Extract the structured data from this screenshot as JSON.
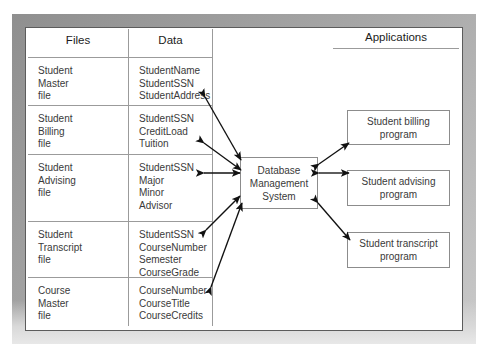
{
  "diagram": {
    "title_applications": "Applications",
    "table": {
      "headers": [
        "Files",
        "Data"
      ],
      "rows": [
        {
          "file": "Student\nMaster\nfile",
          "data": "StudentName\nStudentSSN\nStudentAddress"
        },
        {
          "file": "Student\nBilling\nfile",
          "data": "StudentSSN\nCreditLoad\nTuition"
        },
        {
          "file": "Student\nAdvising\nfile",
          "data": "StudentSSN\nMajor\nMinor\nAdvisor"
        },
        {
          "file": "Student\nTranscript\nfile",
          "data": "StudentSSN\nCourseNumber\nSemester\nCourseGrade"
        },
        {
          "file": "Course\nMaster\nfile",
          "data": "CourseNumber\nCourseTitle\nCourseCredits"
        }
      ]
    },
    "dbms": {
      "label": "Database\nManagement\nSystem"
    },
    "applications": [
      {
        "label": "Student billing\nprogram"
      },
      {
        "label": "Student advising\nprogram"
      },
      {
        "label": "Student transcript\nprogram"
      }
    ],
    "colors": {
      "frame": "#a6a6a6",
      "canvas": "#ffffff",
      "line": "#9b9b9b",
      "box_border": "#8c8c8c",
      "text": "#3a3a3a",
      "heading_text": "#1b1b1b",
      "arrow": "#111111"
    }
  }
}
